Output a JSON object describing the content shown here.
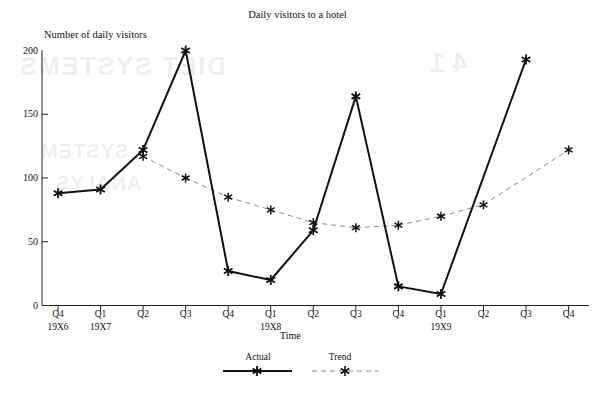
{
  "chart_data": {
    "type": "line",
    "title": "Daily visitors to a hotel",
    "xlabel": "Time",
    "ylabel": "Number of daily visitors",
    "ylim": [
      0,
      200
    ],
    "yticks": [
      0,
      50,
      100,
      150,
      200
    ],
    "grid": false,
    "legend_position": "bottom-center",
    "categories": [
      "Q4",
      "Q1",
      "Q2",
      "Q3",
      "Q4",
      "Q1",
      "Q2",
      "Q3",
      "Q4",
      "Q1",
      "Q2",
      "Q3",
      "Q4"
    ],
    "year_labels": [
      {
        "index": 0,
        "label": "19X6"
      },
      {
        "index": 1,
        "label": "19X7"
      },
      {
        "index": 5,
        "label": "19X8"
      },
      {
        "index": 9,
        "label": "19X9"
      }
    ],
    "series": [
      {
        "name": "Actual",
        "style": "solid",
        "marker": "asterisk",
        "color": "#111111",
        "values": [
          88,
          91,
          122,
          200,
          27,
          20,
          59,
          164,
          15,
          9,
          null,
          193,
          null
        ]
      },
      {
        "name": "Trend",
        "style": "dashed",
        "marker": "asterisk",
        "color": "#8a8a8a",
        "values": [
          null,
          null,
          117,
          100,
          85,
          75,
          65,
          61,
          63,
          70,
          79,
          null,
          122
        ]
      }
    ]
  },
  "legend": {
    "items": [
      {
        "label": "Actual",
        "style": "solid"
      },
      {
        "label": "Trend",
        "style": "dashed"
      }
    ]
  },
  "bleed_through": {
    "line1": "DIET SYSTEMS",
    "line2": "SYSTEM",
    "line3": "ANALYS",
    "line4": "4  1"
  }
}
